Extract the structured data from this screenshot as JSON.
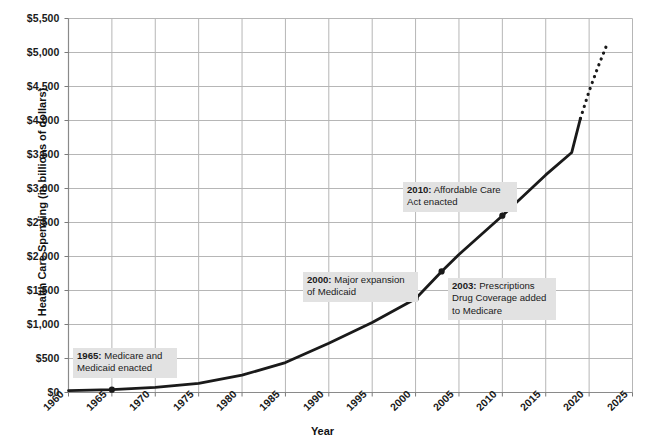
{
  "chart_data": {
    "type": "line",
    "title": "",
    "xlabel": "Year",
    "ylabel": "Health Care Spending (in billions of dollars)",
    "xlim": [
      1960,
      2025
    ],
    "ylim": [
      0,
      5500
    ],
    "grid": true,
    "legend": "none",
    "xticks": [
      1960,
      1965,
      1970,
      1975,
      1980,
      1985,
      1990,
      1995,
      2000,
      2005,
      2010,
      2015,
      2020,
      2025
    ],
    "xtick_labels": [
      "1960",
      "1965",
      "1970",
      "1975",
      "1980",
      "1985",
      "1990",
      "1995",
      "2000",
      "2005",
      "2010",
      "2015",
      "2020",
      "2025"
    ],
    "yticks": [
      0,
      500,
      1000,
      1500,
      2000,
      2500,
      3000,
      3500,
      4000,
      4500,
      5000,
      5500
    ],
    "ytick_labels": [
      "$0",
      "$500",
      "$1,000",
      "$1,500",
      "$2,000",
      "$2,500",
      "$3,000",
      "$3,500",
      "$4,000",
      "$4,500",
      "$5,000",
      "$5,500"
    ],
    "line_color": "#1a1a1a",
    "grid_color": "#b6b6b6",
    "series": [
      {
        "name": "Health care spending (actual)",
        "style": "solid",
        "x": [
          1960,
          1965,
          1970,
          1975,
          1980,
          1985,
          1990,
          1995,
          2000,
          2003,
          2005,
          2010,
          2015,
          2018,
          2019
        ],
        "values": [
          27,
          42,
          75,
          133,
          255,
          440,
          725,
          1030,
          1380,
          1780,
          2030,
          2600,
          3200,
          3530,
          4030
        ]
      },
      {
        "name": "Health care spending (projected)",
        "style": "dotted",
        "x": [
          2019,
          2020,
          2021,
          2022
        ],
        "values": [
          4030,
          4430,
          4780,
          5100
        ]
      }
    ],
    "markers": [
      {
        "x": 1965,
        "y": 42
      },
      {
        "x": 2000,
        "y": 1380
      },
      {
        "x": 2003,
        "y": 1780
      },
      {
        "x": 2010,
        "y": 2600
      }
    ],
    "annotations": [
      {
        "id": "annotation-1965",
        "year": "1965",
        "lines": [
          "1965: Medicare and",
          "Medicaid enacted"
        ],
        "year_label": "1965:",
        "text": " Medicare and Medicaid enacted",
        "line1_rest": " Medicare and",
        "line2": "Medicaid enacted",
        "box": {
          "left": 73,
          "top": 348,
          "width": 104,
          "height": 28
        }
      },
      {
        "id": "annotation-2000",
        "year": "2000",
        "lines": [
          "2000: Major expansion",
          "of Medicaid"
        ],
        "year_label": "2000:",
        "text": " Major expansion of Medicaid",
        "line1_rest": " Major expansion",
        "line2": "of Medicaid",
        "box": {
          "left": 303,
          "top": 272,
          "width": 115,
          "height": 28
        }
      },
      {
        "id": "annotation-2003",
        "year": "2003",
        "lines": [
          "2003: Prescriptions",
          "Drug Coverage added",
          "to Medicare"
        ],
        "year_label": "2003:",
        "text": " Prescriptions Drug Coverage added to Medicare",
        "line1_rest": " Prescriptions",
        "line2": "Drug Coverage added",
        "line3": "to Medicare",
        "box": {
          "left": 448,
          "top": 278,
          "width": 108,
          "height": 41
        }
      },
      {
        "id": "annotation-2010",
        "year": "2010",
        "lines": [
          "2010: Affordable Care",
          "Act enacted"
        ],
        "year_label": "2010:",
        "text": " Affordable Care Act enacted",
        "line1_rest": " Affordable Care",
        "line2": "Act enacted",
        "box": {
          "left": 403,
          "top": 182,
          "width": 114,
          "height": 28
        }
      }
    ]
  }
}
